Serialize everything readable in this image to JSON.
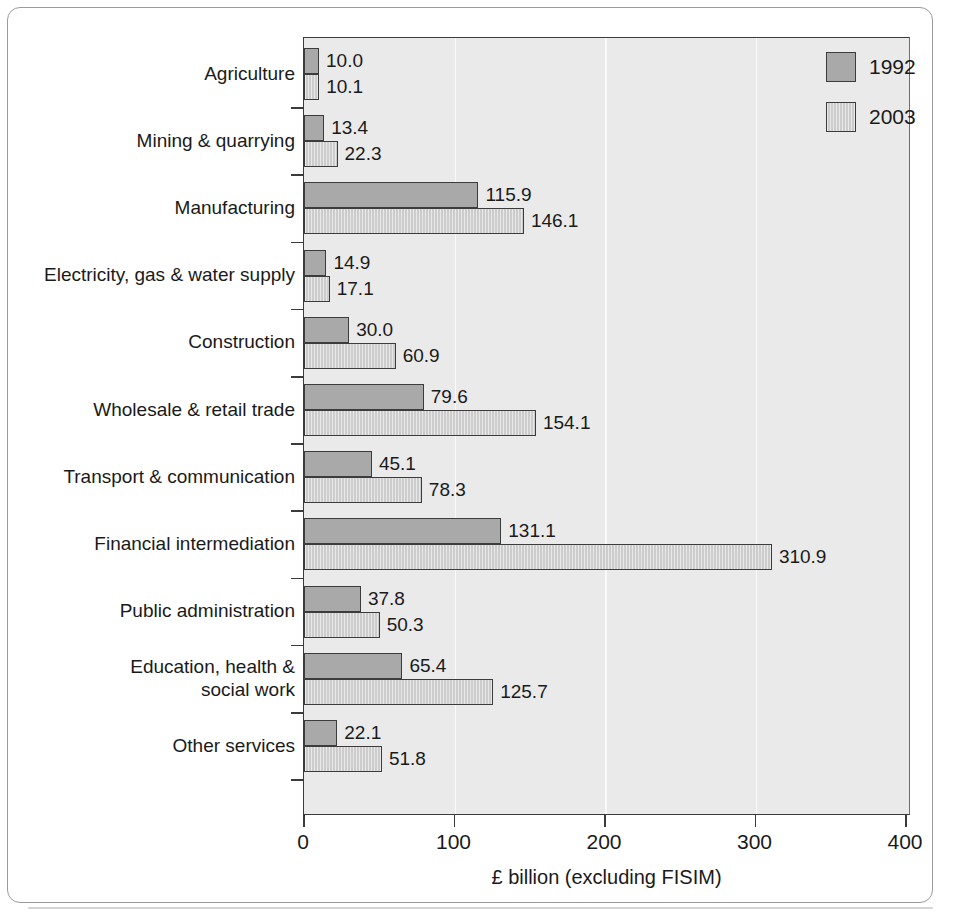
{
  "chart_data": {
    "type": "bar",
    "orientation": "horizontal",
    "title": "",
    "xlabel": "£ billion (excluding FISIM)",
    "ylabel": "",
    "xlim": [
      0,
      400
    ],
    "xticks": [
      0,
      100,
      200,
      300,
      400
    ],
    "xtick_labels": [
      "0",
      "100",
      "200",
      "300",
      "400"
    ],
    "grid": true,
    "grid_axis": "x",
    "legend_position": "top-right-inside",
    "categories": [
      "Agriculture",
      "Mining & quarrying",
      "Manufacturing",
      "Electricity, gas & water supply",
      "Construction",
      "Wholesale & retail trade",
      "Transport & communication",
      "Financial intermediation",
      "Public administration",
      "Education, health &\nsocial work",
      "Other services"
    ],
    "series": [
      {
        "name": "1992",
        "color": "#a9a9a9",
        "values": [
          10.0,
          13.4,
          115.9,
          14.9,
          30.0,
          79.6,
          45.1,
          131.1,
          37.8,
          65.4,
          22.1
        ],
        "value_labels": [
          "10.0",
          "13.4",
          "115.9",
          "14.9",
          "30.0",
          "79.6",
          "45.1",
          "131.1",
          "37.8",
          "65.4",
          "22.1"
        ]
      },
      {
        "name": "2003",
        "color": "#cccccc",
        "values": [
          10.1,
          22.3,
          146.1,
          17.1,
          60.9,
          154.1,
          78.3,
          310.9,
          50.3,
          125.7,
          51.8
        ],
        "value_labels": [
          "10.1",
          "22.3",
          "146.1",
          "17.1",
          "60.9",
          "154.1",
          "78.3",
          "310.9",
          "50.3",
          "125.7",
          "51.8"
        ]
      }
    ]
  },
  "legend": {
    "entries": [
      {
        "label": "1992",
        "swatch": "series-1992-swatch"
      },
      {
        "label": "2003",
        "swatch": "series-2003-swatch"
      }
    ]
  },
  "axis": {
    "x_title": "£ billion (excluding FISIM)"
  },
  "page": {
    "bleed_text": "                    \n                    \n                    \n                    \n                    \n                    \n                    \n                    \n                    \n                    \n                    \n                    \n                    \n                    \n                    \n                    \n                    \n                    \n                    \n                    "
  },
  "colors": {
    "series_1992": "#a9a9a9",
    "series_2003": "#cccccc",
    "plot_background": "#eaeaea",
    "axis": "#3b3b3b",
    "gridline": "#fafafa",
    "text": "#1a1a1a",
    "page_border": "#9b9b9b"
  }
}
